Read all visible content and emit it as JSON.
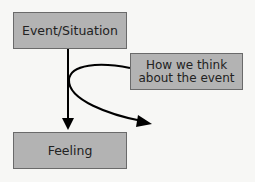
{
  "diagram": {
    "nodes": {
      "event": {
        "label": "Event/Situation"
      },
      "think": {
        "line1": "How we think",
        "line2": "about the event"
      },
      "feeling": {
        "label": "Feeling"
      }
    },
    "edges": [
      {
        "from": "Event/Situation",
        "to": "Feeling",
        "type": "straight-arrow"
      },
      {
        "from": "How we think about the event",
        "to": "deflected",
        "type": "curved-arrow"
      }
    ],
    "colors": {
      "box_fill": "#b3b3b3",
      "box_border": "#6a6a6a",
      "arrow": "#000000",
      "background": "#f7f7f5"
    }
  }
}
